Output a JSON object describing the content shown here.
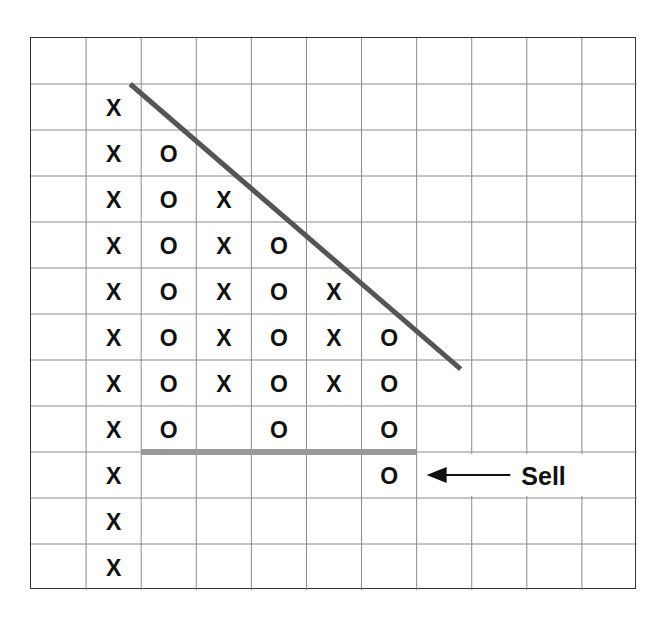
{
  "chart_data": {
    "type": "point-and-figure",
    "title": "",
    "grid": {
      "columns": 11,
      "rows": 12,
      "visible": true
    },
    "columns": [
      {
        "index": 1,
        "symbol": "X",
        "rows": [
          1,
          2,
          3,
          4,
          5,
          6,
          7,
          8,
          9,
          10,
          11
        ]
      },
      {
        "index": 2,
        "symbol": "O",
        "rows": [
          2,
          3,
          4,
          5,
          6,
          7,
          8
        ]
      },
      {
        "index": 3,
        "symbol": "X",
        "rows": [
          3,
          4,
          5,
          6,
          7
        ]
      },
      {
        "index": 4,
        "symbol": "O",
        "rows": [
          4,
          5,
          6,
          7,
          8
        ]
      },
      {
        "index": 5,
        "symbol": "X",
        "rows": [
          5,
          6,
          7
        ]
      },
      {
        "index": 6,
        "symbol": "O",
        "rows": [
          6,
          7,
          8,
          9
        ]
      }
    ],
    "row_layout": [
      "",
      "X",
      "X O",
      "X O X",
      "X O X O",
      "X O X O X",
      "X O X O X O",
      "X O X O X O",
      "X O _ O _ O",
      "X _ _ _ _ O",
      "X",
      "X"
    ],
    "lines": [
      {
        "name": "downtrend-resistance-line",
        "from": [
          1.8,
          1.0
        ],
        "to": [
          7.8,
          7.2
        ],
        "color": "#555555"
      },
      {
        "name": "support-line",
        "from": [
          2.0,
          9.0
        ],
        "to": [
          7.0,
          9.0
        ],
        "color": "#999999"
      }
    ],
    "annotations": [
      {
        "text": "Sell",
        "row": 9,
        "arrow": "left",
        "points_to_column": 6
      }
    ],
    "xlabel": "",
    "ylabel": ""
  },
  "colors": {
    "mark": "#111111",
    "grid": "#8a8a8a",
    "border": "#333333",
    "trendline": "#555555",
    "support": "#999999"
  },
  "annotation": {
    "sell_label": "Sell"
  }
}
